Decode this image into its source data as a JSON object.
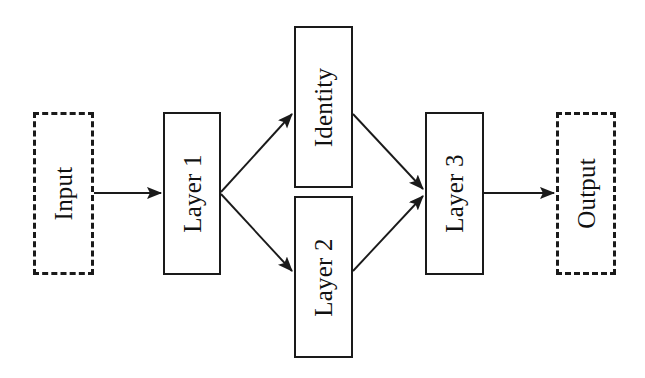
{
  "diagram": {
    "canvas": {
      "width": 645,
      "height": 378,
      "background": "#ffffff"
    },
    "style": {
      "stroke_color": "#1a1a1a",
      "text_color": "#111111",
      "solid_border_width": 2,
      "dashed_border_width": 3,
      "dash_pattern": "7 3",
      "label_rotation_deg": -90,
      "label_font_size": 25
    },
    "nodes": [
      {
        "id": "input",
        "label": "Input",
        "shape": "rectangle",
        "border": "dashed",
        "x": 33,
        "y": 112,
        "width": 61,
        "height": 163
      },
      {
        "id": "layer1",
        "label": "Layer 1",
        "shape": "rectangle",
        "border": "solid",
        "x": 163,
        "y": 112,
        "width": 58,
        "height": 163
      },
      {
        "id": "identity",
        "label": "Identity",
        "shape": "rectangle",
        "border": "solid",
        "x": 294,
        "y": 26,
        "width": 59,
        "height": 162
      },
      {
        "id": "layer2",
        "label": "Layer 2",
        "shape": "rectangle",
        "border": "solid",
        "x": 294,
        "y": 196,
        "width": 59,
        "height": 162
      },
      {
        "id": "layer3",
        "label": "Layer 3",
        "shape": "rectangle",
        "border": "solid",
        "x": 425,
        "y": 112,
        "width": 59,
        "height": 163
      },
      {
        "id": "output",
        "label": "Output",
        "shape": "rectangle",
        "border": "dashed",
        "x": 556,
        "y": 112,
        "width": 60,
        "height": 163
      }
    ],
    "edges": [
      {
        "id": "input-to-layer1",
        "from": "input",
        "to": "layer1",
        "x1": 94,
        "y1": 193,
        "x2": 161,
        "y2": 193,
        "arrowhead": true
      },
      {
        "id": "layer1-to-identity",
        "from": "layer1",
        "to": "identity",
        "x1": 221,
        "y1": 192,
        "x2": 292,
        "y2": 114,
        "arrowhead": true
      },
      {
        "id": "layer1-to-layer2",
        "from": "layer1",
        "to": "layer2",
        "x1": 221,
        "y1": 194,
        "x2": 292,
        "y2": 271,
        "arrowhead": true
      },
      {
        "id": "identity-to-layer3",
        "from": "identity",
        "to": "layer3",
        "x1": 353,
        "y1": 114,
        "x2": 423,
        "y2": 189,
        "arrowhead": true
      },
      {
        "id": "layer2-to-layer3",
        "from": "layer2",
        "to": "layer3",
        "x1": 353,
        "y1": 271,
        "x2": 423,
        "y2": 196,
        "arrowhead": true
      },
      {
        "id": "layer3-to-output",
        "from": "layer3",
        "to": "output",
        "x1": 484,
        "y1": 193,
        "x2": 554,
        "y2": 193,
        "arrowhead": true
      }
    ]
  }
}
